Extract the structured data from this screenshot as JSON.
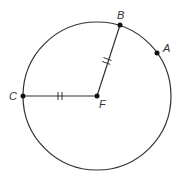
{
  "diagram": {
    "type": "circle-geometry",
    "circle": {
      "center_label": "F",
      "cx": 97,
      "cy": 96,
      "r": 74,
      "stroke": "#333333"
    },
    "points": [
      {
        "label": "A",
        "x": 157,
        "y": 53,
        "label_x": 163,
        "label_y": 52
      },
      {
        "label": "B",
        "x": 120,
        "y": 25,
        "label_x": 117,
        "label_y": 19
      },
      {
        "label": "C",
        "x": 23,
        "y": 96,
        "label_x": 9,
        "label_y": 100
      },
      {
        "label": "F",
        "x": 97,
        "y": 96,
        "label_x": 99,
        "label_y": 108
      }
    ],
    "segments": [
      {
        "from": "F",
        "to": "B",
        "tick_marks": 2
      },
      {
        "from": "C",
        "to": "F",
        "tick_marks": 2
      }
    ],
    "colors": {
      "line": "#333333",
      "point": "#111111",
      "background": "#ffffff"
    }
  }
}
